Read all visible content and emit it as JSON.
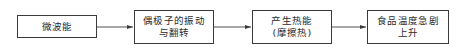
{
  "diagram": {
    "type": "flowchart",
    "direction": "left-to-right",
    "nodes": [
      {
        "id": "n1",
        "lines": [
          "微波能"
        ]
      },
      {
        "id": "n2",
        "lines": [
          "偶极子的振动",
          "与翻转"
        ]
      },
      {
        "id": "n3",
        "lines": [
          "产生热能",
          "(摩擦热)"
        ]
      },
      {
        "id": "n4",
        "lines": [
          "食品温度急剧",
          "上升"
        ]
      }
    ],
    "edges": [
      {
        "from": "n1",
        "to": "n2"
      },
      {
        "from": "n2",
        "to": "n3"
      },
      {
        "from": "n3",
        "to": "n4"
      }
    ],
    "colors": {
      "stroke": "#3a3a3a",
      "text": "#2a2a2a",
      "background": "#ffffff"
    }
  }
}
